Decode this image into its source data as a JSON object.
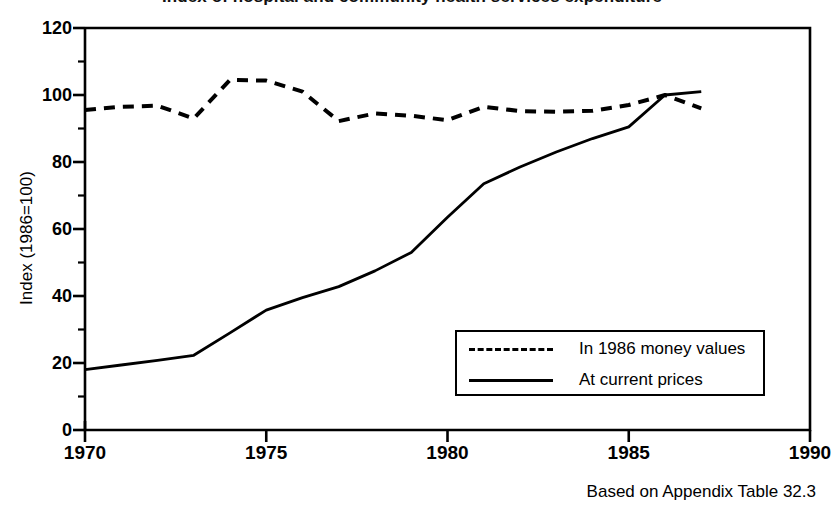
{
  "chart_data": {
    "type": "line",
    "title": "Index of hospital and community health services expenditure",
    "xlabel": "",
    "ylabel": "Index (1986=100)",
    "xlim": [
      1970,
      1990
    ],
    "ylim": [
      0,
      120
    ],
    "grid": false,
    "legend_position": "inside-lower-right",
    "x_ticks": [
      "1970",
      "1975",
      "1980",
      "1985",
      "1990"
    ],
    "x_tick_values": [
      1970,
      1975,
      1980,
      1985,
      1990
    ],
    "y_ticks": [
      "0",
      "20",
      "40",
      "60",
      "80",
      "100",
      "120"
    ],
    "y_tick_values": [
      0,
      20,
      40,
      60,
      80,
      100,
      120
    ],
    "y_minor_tick_values": [
      10,
      30,
      50,
      70,
      90,
      110
    ],
    "x": [
      1970,
      1971,
      1972,
      1973,
      1974,
      1975,
      1976,
      1977,
      1978,
      1979,
      1980,
      1981,
      1982,
      1983,
      1984,
      1985,
      1986,
      1987
    ],
    "series": [
      {
        "name": "In 1986 money values",
        "style": "dashed",
        "color": "#000000",
        "values": [
          95.5,
          96.5,
          96.8,
          93.0,
          104.5,
          104.3,
          101.0,
          92.2,
          94.5,
          93.8,
          92.5,
          96.5,
          95.2,
          95.0,
          95.3,
          97.0,
          100.0,
          96.0
        ]
      },
      {
        "name": "At current prices",
        "style": "solid",
        "color": "#000000",
        "values": [
          18.0,
          19.4,
          20.8,
          22.3,
          29.0,
          35.8,
          39.5,
          42.8,
          47.5,
          53.0,
          63.5,
          73.5,
          78.5,
          83.0,
          87.0,
          90.5,
          100.0,
          101.0
        ]
      }
    ],
    "annotations": []
  },
  "caption": {
    "source_note": "Based on Appendix Table 32.3"
  },
  "legend": {
    "entries": [
      {
        "label": "In 1986 money values",
        "style": "dashed"
      },
      {
        "label": "At current prices",
        "style": "solid"
      }
    ]
  }
}
